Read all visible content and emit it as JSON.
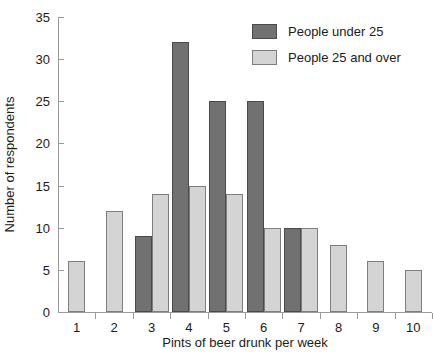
{
  "chart_data": {
    "type": "bar",
    "title": "",
    "xlabel": "Pints of beer drunk per week",
    "ylabel": "Number of respondents",
    "categories": [
      "1",
      "2",
      "3",
      "4",
      "5",
      "6",
      "7",
      "8",
      "9",
      "10"
    ],
    "series": [
      {
        "name": "People under 25",
        "color": "#717171",
        "values": [
          0,
          0,
          9,
          32,
          25,
          25,
          10,
          0,
          0,
          0
        ]
      },
      {
        "name": "People 25 and over",
        "color": "#d4d4d4",
        "values": [
          6,
          12,
          14,
          15,
          14,
          10,
          10,
          8,
          6,
          5
        ]
      }
    ],
    "ylim": [
      0,
      35
    ],
    "yticks": [
      0,
      5,
      10,
      15,
      20,
      25,
      30,
      35
    ],
    "ytick_labels": [
      "0",
      "5",
      "10",
      "15",
      "20",
      "25",
      "30",
      "35"
    ],
    "grid": false,
    "legend_position": "top-right"
  },
  "legend": {
    "items": [
      {
        "label": "People under 25",
        "swatch": "dark"
      },
      {
        "label": "People 25 and over",
        "swatch": "light"
      }
    ]
  }
}
